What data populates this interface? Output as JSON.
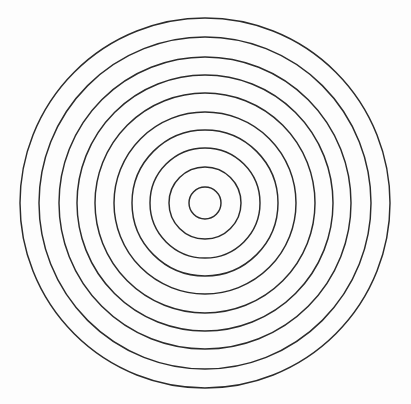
{
  "figure": {
    "name": "concentric-circles-diagram",
    "background_color": "#fdfdfd",
    "width": 411,
    "height": 404,
    "shape_count": 10,
    "shape_type": "circle",
    "fill": "none",
    "stroke_color": "#2b2b2b",
    "stroke_width": 1.45,
    "center": {
      "x": 205,
      "y": 203
    },
    "ring_spacing": 19,
    "has_labels": false,
    "has_axes": false,
    "has_text": false
  },
  "chart_data": {
    "type": "scatter",
    "title": "",
    "subtitle": "",
    "xlabel": "",
    "ylabel": "",
    "grid": false,
    "legend": "none",
    "annotations": [],
    "xlim": [
      0,
      411
    ],
    "ylim": [
      0,
      404
    ],
    "center_x": 205,
    "center_y": 203,
    "radii": [
      16,
      36,
      55,
      73,
      91,
      110,
      128,
      146,
      166,
      185
    ],
    "rings": [
      {
        "index": 1,
        "label": "ring-1",
        "radius": 16,
        "stroke": "#2b2b2b"
      },
      {
        "index": 2,
        "label": "ring-2",
        "radius": 36,
        "stroke": "#2b2b2b"
      },
      {
        "index": 3,
        "label": "ring-3",
        "radius": 55,
        "stroke": "#2b2b2b"
      },
      {
        "index": 4,
        "label": "ring-4",
        "radius": 73,
        "stroke": "#2b2b2b"
      },
      {
        "index": 5,
        "label": "ring-5",
        "radius": 91,
        "stroke": "#2b2b2b"
      },
      {
        "index": 6,
        "label": "ring-6",
        "radius": 110,
        "stroke": "#2b2b2b"
      },
      {
        "index": 7,
        "label": "ring-7",
        "radius": 128,
        "stroke": "#2b2b2b"
      },
      {
        "index": 8,
        "label": "ring-8",
        "radius": 146,
        "stroke": "#2b2b2b"
      },
      {
        "index": 9,
        "label": "ring-9",
        "radius": 166,
        "stroke": "#2b2b2b"
      },
      {
        "index": 10,
        "label": "ring-10",
        "radius": 185,
        "stroke": "#2b2b2b"
      }
    ]
  }
}
